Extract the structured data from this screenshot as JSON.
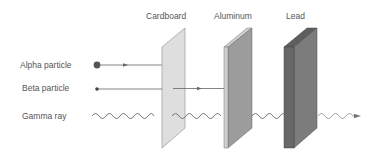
{
  "diagram": {
    "barriers": [
      {
        "label": "Cardboard",
        "color": "#dcdcdc"
      },
      {
        "label": "Aluminum",
        "color": "#9a9a9a"
      },
      {
        "label": "Lead",
        "color": "#6e6e6e"
      }
    ],
    "radiation": [
      {
        "label": "Alpha particle",
        "stopped_by": "Cardboard"
      },
      {
        "label": "Beta particle",
        "stopped_by": "Aluminum"
      },
      {
        "label": "Gamma ray",
        "stopped_by": "none (attenuated by Lead)"
      }
    ],
    "colors": {
      "text": "#555555",
      "line": "#666666"
    }
  }
}
